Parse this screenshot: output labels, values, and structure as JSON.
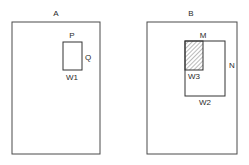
{
  "panels": [
    {
      "id": "A",
      "title": "A",
      "frame": {
        "x": 12,
        "y": 22,
        "w": 88,
        "h": 132
      },
      "window": {
        "label": "W1",
        "rect": {
          "x": 63,
          "y": 42,
          "w": 19,
          "h": 28
        },
        "top_label": "P",
        "side_label": "Q"
      }
    },
    {
      "id": "B",
      "title": "B",
      "frame": {
        "x": 147,
        "y": 22,
        "w": 90,
        "h": 132
      },
      "outer_window": {
        "label": "W2",
        "rect": {
          "x": 185,
          "y": 41,
          "w": 40,
          "h": 55
        },
        "top_label": "M",
        "side_label": "N"
      },
      "inner_window": {
        "label": "W3",
        "rect": {
          "x": 185,
          "y": 41,
          "w": 18,
          "h": 29
        },
        "fill": "hatched"
      }
    }
  ],
  "colors": {
    "line": "#333333",
    "text": "#2a2a2a",
    "background": "#ffffff"
  }
}
